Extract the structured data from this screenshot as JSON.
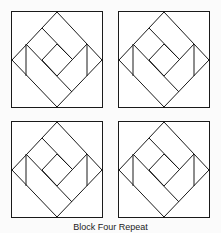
{
  "figure": {
    "caption": "Block Four Repeat",
    "line_color": "#1a1a1a",
    "fill_color": "#ffffff",
    "blocks": [
      {
        "position": "top-left",
        "x": 11,
        "y": 11
      },
      {
        "position": "top-right",
        "x": 118,
        "y": 11
      },
      {
        "position": "bottom-left",
        "x": 11,
        "y": 121
      },
      {
        "position": "bottom-right",
        "x": 118,
        "y": 121
      }
    ]
  }
}
